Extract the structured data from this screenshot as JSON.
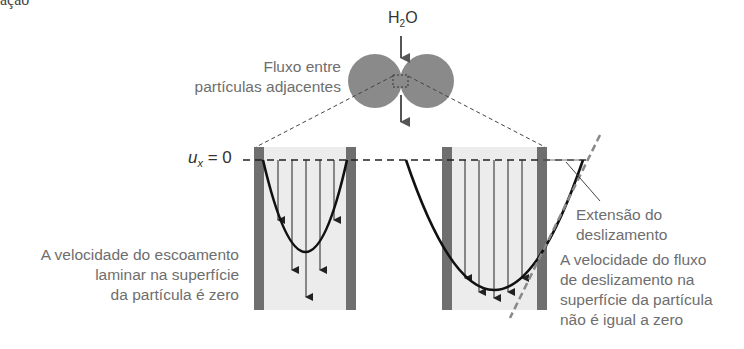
{
  "figure": {
    "top_fragment": "ação",
    "water_label": "H",
    "water_sub": "2",
    "water_label_end": "O",
    "flow_between_label": [
      "Fluxo entre",
      "partículas adjacentes"
    ],
    "ux_label": "u",
    "ux_sub": "x",
    "ux_rest": " = 0",
    "left_panel": {
      "caption": [
        "A velocidade do escoamento",
        "laminar na superfície",
        "da partícula é zero"
      ]
    },
    "right_panel": {
      "slip_label": [
        "Extensão do",
        "deslizamento"
      ],
      "caption": [
        "A velocidade do fluxo",
        "de deslizamento na",
        "superfície da partícula",
        "não é igual a zero"
      ]
    },
    "colors": {
      "particle": "#8a8a8a",
      "wall": "#6f6f6f",
      "channel": "#ececec",
      "text": "#6e6e6e",
      "curve": "#111111"
    }
  }
}
